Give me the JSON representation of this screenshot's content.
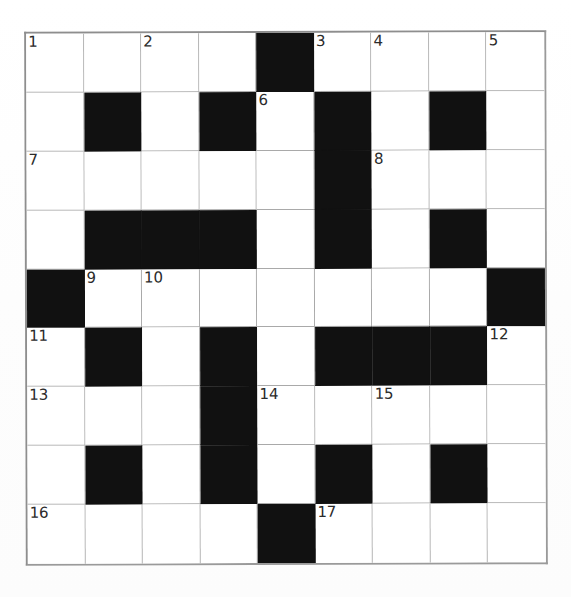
{
  "puzzle": {
    "title": "Crossword Grid",
    "rows": 9,
    "cols": 9,
    "colors": {
      "block": "#111111",
      "cell_background": "#ffffff",
      "grid_line": "#a9a9a9",
      "outer_border": "#8e8e8e",
      "number_text": "#2b2b2b",
      "page_background": "#fefefe"
    },
    "numbers_visible": [
      "1",
      "2",
      "3",
      "4",
      "5",
      "6",
      "7",
      "8",
      "9",
      "10",
      "11",
      "12",
      "13",
      "14",
      "15",
      "16",
      "17"
    ],
    "grid": [
      [
        {
          "block": false,
          "number": "1",
          "letter": ""
        },
        {
          "block": false,
          "number": "",
          "letter": ""
        },
        {
          "block": false,
          "number": "2",
          "letter": ""
        },
        {
          "block": false,
          "number": "",
          "letter": ""
        },
        {
          "block": true,
          "number": "",
          "letter": ""
        },
        {
          "block": false,
          "number": "3",
          "letter": ""
        },
        {
          "block": false,
          "number": "4",
          "letter": ""
        },
        {
          "block": false,
          "number": "",
          "letter": ""
        },
        {
          "block": false,
          "number": "5",
          "letter": ""
        }
      ],
      [
        {
          "block": false,
          "number": "",
          "letter": ""
        },
        {
          "block": true,
          "number": "",
          "letter": ""
        },
        {
          "block": false,
          "number": "",
          "letter": ""
        },
        {
          "block": true,
          "number": "",
          "letter": ""
        },
        {
          "block": false,
          "number": "6",
          "letter": ""
        },
        {
          "block": true,
          "number": "",
          "letter": ""
        },
        {
          "block": false,
          "number": "",
          "letter": ""
        },
        {
          "block": true,
          "number": "",
          "letter": ""
        },
        {
          "block": false,
          "number": "",
          "letter": ""
        }
      ],
      [
        {
          "block": false,
          "number": "7",
          "letter": ""
        },
        {
          "block": false,
          "number": "",
          "letter": ""
        },
        {
          "block": false,
          "number": "",
          "letter": ""
        },
        {
          "block": false,
          "number": "",
          "letter": ""
        },
        {
          "block": false,
          "number": "",
          "letter": ""
        },
        {
          "block": true,
          "number": "",
          "letter": ""
        },
        {
          "block": false,
          "number": "8",
          "letter": ""
        },
        {
          "block": false,
          "number": "",
          "letter": ""
        },
        {
          "block": false,
          "number": "",
          "letter": ""
        }
      ],
      [
        {
          "block": false,
          "number": "",
          "letter": ""
        },
        {
          "block": true,
          "number": "",
          "letter": ""
        },
        {
          "block": true,
          "number": "",
          "letter": ""
        },
        {
          "block": true,
          "number": "",
          "letter": ""
        },
        {
          "block": false,
          "number": "",
          "letter": ""
        },
        {
          "block": true,
          "number": "",
          "letter": ""
        },
        {
          "block": false,
          "number": "",
          "letter": ""
        },
        {
          "block": true,
          "number": "",
          "letter": ""
        },
        {
          "block": false,
          "number": "",
          "letter": ""
        }
      ],
      [
        {
          "block": true,
          "number": "",
          "letter": ""
        },
        {
          "block": false,
          "number": "9",
          "letter": ""
        },
        {
          "block": false,
          "number": "10",
          "letter": ""
        },
        {
          "block": false,
          "number": "",
          "letter": ""
        },
        {
          "block": false,
          "number": "",
          "letter": ""
        },
        {
          "block": false,
          "number": "",
          "letter": ""
        },
        {
          "block": false,
          "number": "",
          "letter": ""
        },
        {
          "block": false,
          "number": "",
          "letter": ""
        },
        {
          "block": true,
          "number": "",
          "letter": ""
        }
      ],
      [
        {
          "block": false,
          "number": "11",
          "letter": ""
        },
        {
          "block": true,
          "number": "",
          "letter": ""
        },
        {
          "block": false,
          "number": "",
          "letter": ""
        },
        {
          "block": true,
          "number": "",
          "letter": ""
        },
        {
          "block": false,
          "number": "",
          "letter": ""
        },
        {
          "block": true,
          "number": "",
          "letter": ""
        },
        {
          "block": true,
          "number": "",
          "letter": ""
        },
        {
          "block": true,
          "number": "",
          "letter": ""
        },
        {
          "block": false,
          "number": "12",
          "letter": ""
        }
      ],
      [
        {
          "block": false,
          "number": "13",
          "letter": ""
        },
        {
          "block": false,
          "number": "",
          "letter": ""
        },
        {
          "block": false,
          "number": "",
          "letter": ""
        },
        {
          "block": true,
          "number": "",
          "letter": ""
        },
        {
          "block": false,
          "number": "14",
          "letter": ""
        },
        {
          "block": false,
          "number": "",
          "letter": ""
        },
        {
          "block": false,
          "number": "15",
          "letter": ""
        },
        {
          "block": false,
          "number": "",
          "letter": ""
        },
        {
          "block": false,
          "number": "",
          "letter": ""
        }
      ],
      [
        {
          "block": false,
          "number": "",
          "letter": ""
        },
        {
          "block": true,
          "number": "",
          "letter": ""
        },
        {
          "block": false,
          "number": "",
          "letter": ""
        },
        {
          "block": true,
          "number": "",
          "letter": ""
        },
        {
          "block": false,
          "number": "",
          "letter": ""
        },
        {
          "block": true,
          "number": "",
          "letter": ""
        },
        {
          "block": false,
          "number": "",
          "letter": ""
        },
        {
          "block": true,
          "number": "",
          "letter": ""
        },
        {
          "block": false,
          "number": "",
          "letter": ""
        }
      ],
      [
        {
          "block": false,
          "number": "16",
          "letter": ""
        },
        {
          "block": false,
          "number": "",
          "letter": ""
        },
        {
          "block": false,
          "number": "",
          "letter": ""
        },
        {
          "block": false,
          "number": "",
          "letter": ""
        },
        {
          "block": true,
          "number": "",
          "letter": ""
        },
        {
          "block": false,
          "number": "17",
          "letter": ""
        },
        {
          "block": false,
          "number": "",
          "letter": ""
        },
        {
          "block": false,
          "number": "",
          "letter": ""
        },
        {
          "block": false,
          "number": "",
          "letter": ""
        }
      ]
    ]
  }
}
